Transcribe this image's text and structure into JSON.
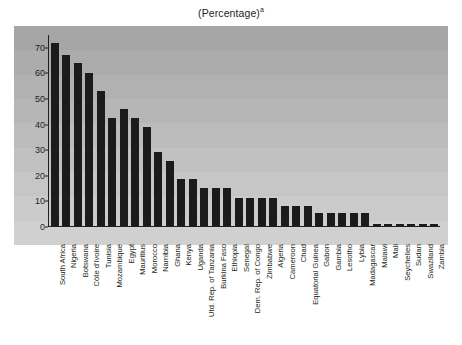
{
  "chart_data": {
    "type": "bar",
    "title": "(Percentage)",
    "title_superscript": "a",
    "xlabel": "",
    "ylabel": "",
    "ylim": [
      0,
      75
    ],
    "yticks": [
      0,
      10,
      20,
      30,
      40,
      50,
      60,
      70
    ],
    "grid": "horizontal-bands",
    "legend": "none",
    "bar_color": "#1b1b1b",
    "plot_background": "#b9b9b9",
    "categories": [
      "South Africa",
      "Nigeria",
      "Botswana",
      "Côte d'Ivoire",
      "Tunisia",
      "Mozambique",
      "Egypt",
      "Mauritius",
      "Morocco",
      "Namibia",
      "Ghana",
      "Kenya",
      "Uganda",
      "Utd. Rep. of Tanzania",
      "Burkina Faso",
      "Ethiopia",
      "Senegal",
      "Dem. Rep. of Congo",
      "Zimbabwe",
      "Algeria",
      "Cameroon",
      "Chad",
      "Equatorial Guinea",
      "Gabon",
      "Gambia",
      "Lesotho",
      "Lybia",
      "Madagascar",
      "Malawi",
      "Mali",
      "Seychelles",
      "Sudan",
      "Swaziland",
      "Zambia"
    ],
    "values": [
      72,
      67,
      64,
      60,
      53,
      42.5,
      46,
      42.5,
      39,
      29,
      25.5,
      18.5,
      18.5,
      15,
      15,
      15,
      11,
      11,
      11,
      11,
      8,
      8,
      8,
      5,
      5,
      5,
      5,
      5,
      0.6,
      0.6,
      0.6,
      0.6,
      0.6,
      0.6
    ]
  }
}
